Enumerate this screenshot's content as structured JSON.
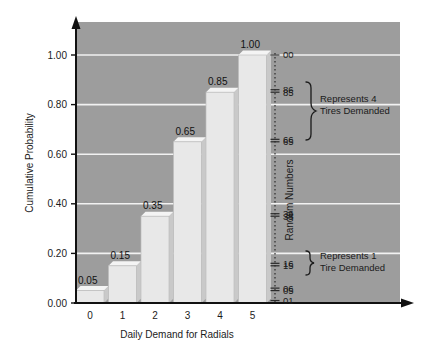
{
  "chart_data": {
    "type": "bar",
    "title": "",
    "xlabel": "Daily Demand for Radials",
    "ylabel": "Cumulative Probability",
    "categories": [
      "0",
      "1",
      "2",
      "3",
      "4",
      "5"
    ],
    "values": [
      0.05,
      0.15,
      0.35,
      0.65,
      0.85,
      1.0
    ],
    "data_labels": [
      "0.05",
      "0.15",
      "0.35",
      "0.65",
      "0.85",
      "1.00"
    ],
    "ylim": [
      0.0,
      1.0
    ],
    "yticks": [
      "0.00",
      "0.20",
      "0.40",
      "0.60",
      "0.80",
      "1.00"
    ],
    "ytick_values": [
      0.0,
      0.2,
      0.4,
      0.6,
      0.8,
      1.0
    ],
    "grid": true,
    "legend": "none",
    "secondary_axis": {
      "label": "Random Numbers",
      "ticks": [
        "00",
        "86",
        "85",
        "66",
        "65",
        "36",
        "35",
        "16",
        "15",
        "06",
        "05",
        "01"
      ],
      "tick_values": [
        1.0,
        0.86,
        0.85,
        0.66,
        0.65,
        0.36,
        0.35,
        0.16,
        0.15,
        0.06,
        0.05,
        0.01
      ]
    },
    "annotations": [
      {
        "line1": "Represents 4",
        "line2": "Tires Demanded",
        "from": 0.86,
        "to": 0.65
      },
      {
        "line1": "Represents 1",
        "line2": "Tire Demanded",
        "from": 0.16,
        "to": 0.06
      }
    ],
    "colors": {
      "plot_background": "#9d9d9d",
      "bar_fill": "#e8e8e8",
      "bar_side": "#c9c9c9",
      "gridline": "#f2f2f2",
      "axis": "#111111",
      "text": "#1b1b1b",
      "page_background": "#ffffff"
    }
  }
}
